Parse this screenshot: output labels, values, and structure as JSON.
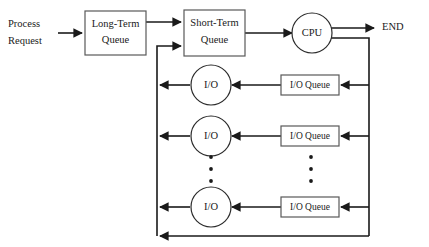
{
  "diagram": {
    "type": "flow-diagram",
    "background_color": "#ffffff",
    "line_color": "#1a1a1a",
    "box_stroke_color": "#595959",
    "text_color": "#1a1a1a",
    "labels": {
      "process_request_line1": "Process",
      "process_request_line2": "Request",
      "long_term_queue_line1": "Long-Term",
      "long_term_queue_line2": "Queue",
      "short_term_queue_line1": "Short-Term",
      "short_term_queue_line2": "Queue",
      "cpu": "CPU",
      "end": "END",
      "io_1": "I/O",
      "io_2": "I/O",
      "io_3": "I/O",
      "io_queue_1": "I/O Queue",
      "io_queue_2": "I/O Queue",
      "io_queue_3": "I/O Queue"
    },
    "ellipsis": {
      "left_column_label": "vertical-ellipsis",
      "right_column_label": "vertical-ellipsis",
      "dot_count": 3
    }
  }
}
